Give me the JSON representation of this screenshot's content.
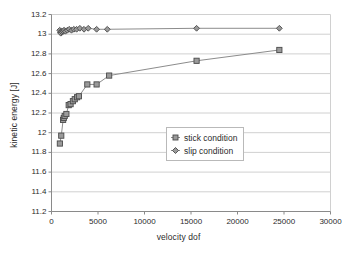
{
  "chart_data": {
    "type": "scatter",
    "title": "",
    "xlabel": "velocity dof",
    "ylabel": "kinetic energy [J]",
    "xlim": [
      0,
      30000
    ],
    "ylim": [
      11.2,
      13.2
    ],
    "xticks": [
      "0",
      "5000",
      "10000",
      "15000",
      "20000",
      "25000",
      "30000"
    ],
    "xtick_values": [
      0,
      5000,
      10000,
      15000,
      20000,
      25000,
      30000
    ],
    "yticks": [
      "11.2",
      "11.4",
      "11.6",
      "11.8",
      "12",
      "12.2",
      "12.4",
      "12.6",
      "12.8",
      "13",
      "13.2"
    ],
    "ytick_values": [
      11.2,
      11.4,
      11.6,
      11.8,
      12.0,
      12.2,
      12.4,
      12.6,
      12.8,
      13.0,
      13.2
    ],
    "grid": "horizontal",
    "legend_position": "center",
    "series": [
      {
        "name": "stick condition",
        "marker": "square",
        "color": "#808080",
        "points": [
          [
            900,
            11.89
          ],
          [
            1050,
            11.97
          ],
          [
            1250,
            12.13
          ],
          [
            1320,
            12.15
          ],
          [
            1420,
            12.17
          ],
          [
            1600,
            12.19
          ],
          [
            1850,
            12.28
          ],
          [
            2050,
            12.29
          ],
          [
            2300,
            12.32
          ],
          [
            2500,
            12.34
          ],
          [
            2750,
            12.36
          ],
          [
            2950,
            12.37
          ],
          [
            3850,
            12.49
          ],
          [
            4850,
            12.49
          ],
          [
            6200,
            12.58
          ],
          [
            15600,
            12.73
          ],
          [
            24500,
            12.84
          ]
        ]
      },
      {
        "name": "slip condition",
        "marker": "diamond",
        "color": "#808080",
        "points": [
          [
            880,
            13.04
          ],
          [
            950,
            13.02
          ],
          [
            1000,
            13.01
          ],
          [
            1080,
            13.03
          ],
          [
            1150,
            13.02
          ],
          [
            1250,
            13.03
          ],
          [
            1350,
            13.04
          ],
          [
            1500,
            13.03
          ],
          [
            1700,
            13.04
          ],
          [
            1900,
            13.05
          ],
          [
            2150,
            13.04
          ],
          [
            2400,
            13.05
          ],
          [
            2700,
            13.05
          ],
          [
            3050,
            13.06
          ],
          [
            3500,
            13.05
          ],
          [
            3950,
            13.06
          ],
          [
            4850,
            13.05
          ],
          [
            6000,
            13.05
          ],
          [
            15600,
            13.06
          ],
          [
            24500,
            13.06
          ]
        ]
      }
    ],
    "legend": [
      {
        "label": "stick condition",
        "marker": "square"
      },
      {
        "label": "slip condition",
        "marker": "diamond"
      }
    ]
  }
}
